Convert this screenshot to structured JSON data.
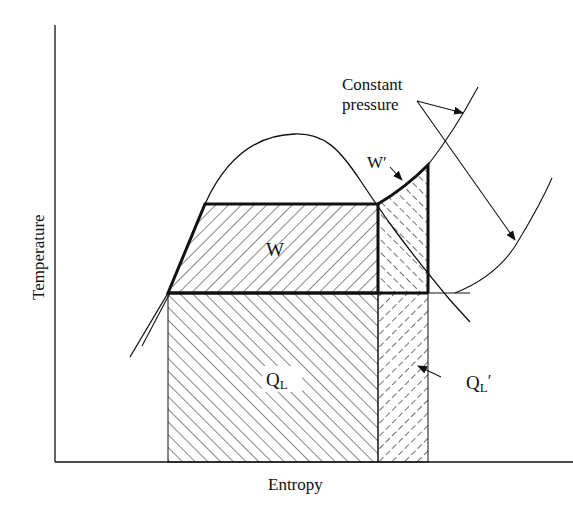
{
  "diagram": {
    "type": "T-s diagram (refrigeration cycle comparison)",
    "axes": {
      "x_label": "Entropy",
      "y_label": "Temperature"
    },
    "labels": {
      "work_area": "W",
      "work_prime_main": "W",
      "work_prime_mark": "′",
      "heat_low_main": "Q",
      "heat_low_sub": "L",
      "heat_low_prime_main": "Q",
      "heat_low_prime_sub": "L",
      "heat_low_prime_mark": "′",
      "constant_pressure_line1": "Constant",
      "constant_pressure_line2": "pressure"
    },
    "colors": {
      "ink": "#111111",
      "background": "#ffffff"
    }
  }
}
